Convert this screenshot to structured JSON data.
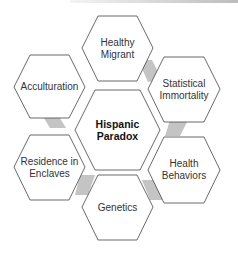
{
  "diagram": {
    "center": {
      "line1": "Hispanic",
      "line2": "Paradox"
    },
    "nodes": [
      {
        "id": "healthy-migrant",
        "line1": "Healthy",
        "line2": "Migrant"
      },
      {
        "id": "statistical-immortality",
        "line1": "Statistical",
        "line2": "Immortality"
      },
      {
        "id": "health-behaviors",
        "line1": "Health",
        "line2": "Behaviors"
      },
      {
        "id": "genetics",
        "line1": "Genetics",
        "line2": ""
      },
      {
        "id": "residence-in-enclaves",
        "line1": "Residence in",
        "line2": "Enclaves"
      },
      {
        "id": "acculturation",
        "line1": "Acculturation",
        "line2": ""
      }
    ],
    "colors": {
      "stroke": "#444444",
      "connector": "#c4c4c4",
      "fill": "#ffffff"
    }
  }
}
